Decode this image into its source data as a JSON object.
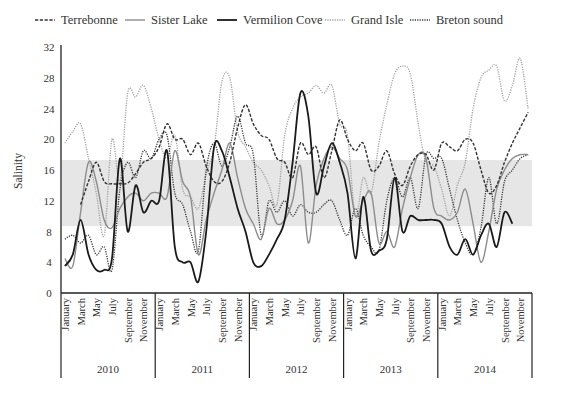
{
  "chart_data": {
    "type": "line",
    "title": "",
    "xlabel": "",
    "ylabel": "Salinity",
    "ylim": [
      0,
      32
    ],
    "yticks": [
      0,
      4,
      8,
      12,
      16,
      20,
      24,
      28,
      32
    ],
    "grid": false,
    "legend_position": "top",
    "shaded_band": {
      "from": 8.7,
      "to": 17.3,
      "color": "#e6e6e6"
    },
    "years": [
      "2010",
      "2011",
      "2012",
      "2013",
      "2014"
    ],
    "month_labels": [
      "January",
      "March",
      "May",
      "July",
      "September",
      "November"
    ],
    "x_months": [
      "2010-01",
      "2010-02",
      "2010-03",
      "2010-04",
      "2010-05",
      "2010-06",
      "2010-07",
      "2010-08",
      "2010-09",
      "2010-10",
      "2010-11",
      "2010-12",
      "2011-01",
      "2011-02",
      "2011-03",
      "2011-04",
      "2011-05",
      "2011-06",
      "2011-07",
      "2011-08",
      "2011-09",
      "2011-10",
      "2011-11",
      "2011-12",
      "2012-01",
      "2012-02",
      "2012-03",
      "2012-04",
      "2012-05",
      "2012-06",
      "2012-07",
      "2012-08",
      "2012-09",
      "2012-10",
      "2012-11",
      "2012-12",
      "2013-01",
      "2013-02",
      "2013-03",
      "2013-04",
      "2013-05",
      "2013-06",
      "2013-07",
      "2013-08",
      "2013-09",
      "2013-10",
      "2013-11",
      "2013-12",
      "2014-01",
      "2014-02",
      "2014-03",
      "2014-04",
      "2014-05",
      "2014-06",
      "2014-07",
      "2014-08",
      "2014-09",
      "2014-10",
      "2014-11",
      "2014-12"
    ],
    "series": [
      {
        "name": "Terrebonne",
        "style": "dashed",
        "color": "#333333",
        "width": 1.4,
        "values": [
          null,
          null,
          11.5,
          14.5,
          17.0,
          14.5,
          14.2,
          14.2,
          14.3,
          15.5,
          17.0,
          17.5,
          19.0,
          22.0,
          20.0,
          20.0,
          18.0,
          19.5,
          16.5,
          14.5,
          14.5,
          17.0,
          21.5,
          24.5,
          22.0,
          20.5,
          20.0,
          17.5,
          17.0,
          15.0,
          19.5,
          18.0,
          19.0,
          15.0,
          18.5,
          22.5,
          20.0,
          18.5,
          19.5,
          16.0,
          16.5,
          18.5,
          15.5,
          14.0,
          16.5,
          18.0,
          18.0,
          16.0,
          19.5,
          19.0,
          18.5,
          20.0,
          19.5,
          16.0,
          13.0,
          14.0,
          17.0,
          19.5,
          21.5,
          23.5
        ]
      },
      {
        "name": "Sister Lake",
        "style": "solid",
        "color": "#8c8c8c",
        "width": 1.4,
        "values": [
          4.5,
          3.5,
          10.5,
          17.0,
          14.5,
          9.5,
          8.5,
          11.0,
          12.5,
          13.0,
          12.0,
          13.0,
          13.0,
          12.5,
          18.5,
          14.5,
          12.5,
          5.0,
          9.5,
          13.0,
          16.0,
          19.5,
          15.0,
          11.0,
          9.0,
          7.0,
          11.0,
          9.0,
          9.5,
          12.0,
          16.5,
          6.5,
          14.0,
          17.5,
          19.0,
          17.5,
          16.0,
          10.0,
          12.0,
          13.0,
          6.5,
          8.0,
          6.0,
          11.0,
          15.0,
          18.0,
          17.5,
          11.0,
          10.0,
          9.5,
          10.5,
          13.5,
          9.0,
          4.0,
          8.0,
          13.5,
          16.0,
          17.5,
          18.0,
          18.0
        ]
      },
      {
        "name": "Vermilion Cove",
        "style": "solid",
        "color": "#1a1a1a",
        "width": 1.8,
        "values": [
          3.5,
          5.0,
          9.5,
          5.0,
          3.0,
          3.0,
          4.5,
          17.5,
          8.0,
          14.0,
          10.5,
          12.0,
          12.0,
          18.5,
          6.0,
          4.0,
          4.0,
          1.5,
          8.0,
          19.0,
          18.5,
          15.0,
          11.0,
          8.0,
          4.0,
          3.5,
          5.0,
          7.0,
          9.5,
          17.0,
          26.0,
          23.0,
          13.0,
          16.5,
          19.5,
          17.0,
          13.0,
          4.5,
          12.5,
          5.5,
          5.5,
          7.0,
          15.0,
          8.0,
          10.0,
          9.5,
          9.5,
          9.5,
          9.0,
          6.0,
          5.0,
          7.0,
          5.0,
          7.5,
          9.0,
          6.0,
          10.5,
          9.0,
          null,
          null
        ]
      },
      {
        "name": "Grand Isle",
        "style": "dotted",
        "color": "#a0a0a0",
        "width": 1.3,
        "values": [
          19.5,
          21.0,
          22.0,
          17.5,
          13.0,
          7.5,
          20.0,
          14.5,
          26.0,
          25.5,
          27.0,
          24.0,
          20.0,
          17.5,
          20.5,
          13.5,
          12.5,
          11.0,
          15.5,
          19.0,
          27.5,
          28.0,
          21.0,
          19.0,
          17.0,
          16.0,
          14.0,
          11.5,
          20.5,
          24.0,
          25.5,
          26.0,
          27.0,
          26.0,
          27.0,
          22.0,
          20.5,
          10.0,
          15.0,
          13.0,
          19.5,
          24.5,
          28.5,
          29.5,
          28.5,
          22.0,
          17.0,
          16.5,
          13.5,
          10.0,
          14.0,
          17.0,
          24.0,
          28.0,
          29.0,
          29.5,
          25.0,
          27.0,
          30.5,
          24.0
        ]
      },
      {
        "name": "Breton sound",
        "style": "dotted",
        "color": "#333333",
        "width": 1.3,
        "values": [
          7.0,
          7.5,
          6.5,
          7.5,
          5.0,
          6.0,
          3.0,
          13.5,
          17.0,
          15.0,
          18.5,
          17.5,
          20.0,
          20.5,
          13.0,
          11.5,
          8.0,
          5.5,
          16.0,
          19.5,
          16.5,
          19.0,
          23.0,
          19.5,
          18.0,
          7.5,
          12.0,
          10.5,
          12.0,
          10.0,
          11.5,
          10.5,
          10.5,
          11.5,
          12.0,
          9.5,
          7.5,
          11.0,
          7.5,
          6.0,
          5.5,
          12.0,
          15.0,
          12.5,
          15.0,
          11.0,
          18.0,
          17.5,
          17.5,
          13.5,
          9.5,
          6.5,
          5.0,
          8.5,
          15.0,
          9.0,
          14.5,
          16.0,
          17.5,
          18.0
        ]
      }
    ]
  }
}
